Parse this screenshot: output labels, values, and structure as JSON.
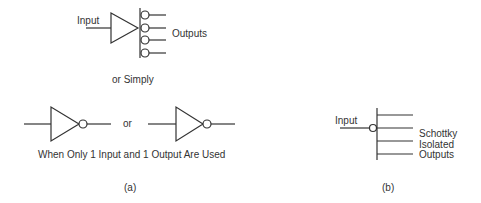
{
  "figure_a": {
    "top": {
      "input_label": "Input",
      "outputs_label": "Outputs",
      "output_count": 4
    },
    "or_simply_label": "or Simply",
    "bottom": {
      "or_label": "or",
      "caption": "When Only 1 Input and 1 Output Are Used"
    },
    "label": "(a)"
  },
  "figure_b": {
    "input_label": "Input",
    "outputs_label_lines": [
      "Schottky",
      "Isolated",
      "Outputs"
    ],
    "output_count": 4,
    "label": "(b)"
  },
  "colors": {
    "line": "#333333",
    "background": "#ffffff"
  }
}
